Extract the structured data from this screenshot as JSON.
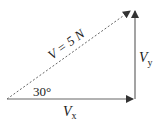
{
  "diagram": {
    "title": "",
    "vector_label": "V = 5 N",
    "angle_label": "30°",
    "x_component": {
      "main": "V",
      "sub": "x"
    },
    "y_component": {
      "main": "V",
      "sub": "y"
    },
    "colors": {
      "line": "#555555",
      "text": "#222222",
      "background": "#ffffff"
    }
  }
}
